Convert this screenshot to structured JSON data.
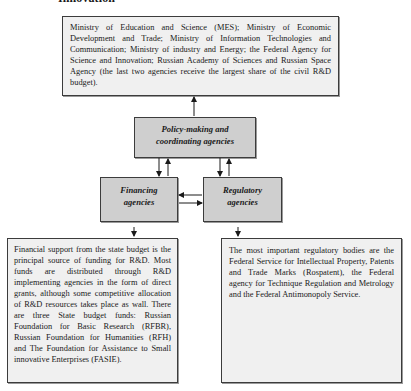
{
  "title": "Innovation",
  "boxes": {
    "ministries": {
      "text": "Ministry of Education and Science (MES); Ministry of Economic Development and Trade; Ministry of Information Technologies and Communication; Ministry of industry and Energy; the Federal Agency for Science and Innovation; Russian Academy of Sciences and Russian Space Agency (the last two agencies receive the largest share of the civil R&D budget)."
    },
    "policy": {
      "line1": "Policy-making and",
      "line2": "coordinating agencies"
    },
    "financing": {
      "line1": "Financing",
      "line2": "agencies"
    },
    "regulatory": {
      "line1": "Regulatory",
      "line2": "agencies"
    },
    "financial_support": {
      "text": "Financial support from the state budget is the principal source of funding for R&D. Most funds are distributed through R&D implementing agencies in the form of direct grants, although some competitive allocation of R&D resources takes place as wall. There are three State budget funds: Russian Foundation for Basic Research (RFBR), Russian Foundation for Humanities (RFH) and The Foundation for Assistance to Small innovative Enterprises (FASIE)."
    },
    "regulatory_bodies": {
      "text": "The most important regulatory bodies are the Federal Service for Intellectual Property, Patents and Trade Marks (Rospatent), the Federal agency for Technique Regulation and Metrology and the Federal Antimonopoly Service."
    }
  },
  "connections": [
    {
      "from": "policy",
      "to": "ministries"
    },
    {
      "from": "policy",
      "to": "financing"
    },
    {
      "from": "financing",
      "to": "policy"
    },
    {
      "from": "policy",
      "to": "regulatory"
    },
    {
      "from": "regulatory",
      "to": "policy"
    },
    {
      "from": "regulatory",
      "to": "financing"
    },
    {
      "from": "financing",
      "to": "regulatory"
    },
    {
      "from": "financing",
      "to": "financial_support"
    },
    {
      "from": "regulatory",
      "to": "regulatory_bodies"
    }
  ],
  "colors": {
    "light_box": "#f0f0f0",
    "dark_box": "#cfcfcf",
    "border": "#3c3c3c"
  }
}
